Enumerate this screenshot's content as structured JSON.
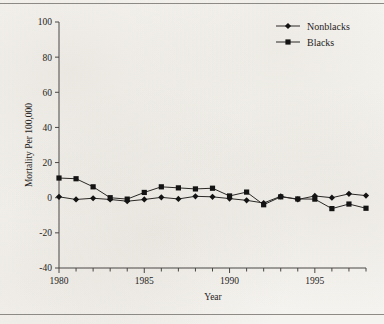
{
  "figure": {
    "background_color": "#f4f2ee",
    "ink_color": "#1a1a1a",
    "top_rule": "horizontal-rule",
    "bottom_rule": "horizontal-rule"
  },
  "chart_data": {
    "type": "line",
    "title": "",
    "xlabel": "Year",
    "ylabel": "Mortality Per 100,000",
    "xlim": [
      1980,
      1998
    ],
    "ylim": [
      -40,
      100
    ],
    "xticks": [
      1980,
      1985,
      1990,
      1995
    ],
    "xtick_labels": [
      "1980",
      "1985",
      "1990",
      "1995"
    ],
    "x_minor_ticks": [
      1981,
      1982,
      1983,
      1984,
      1986,
      1987,
      1988,
      1989,
      1991,
      1992,
      1993,
      1994,
      1996,
      1997,
      1998
    ],
    "yticks": [
      -40,
      -20,
      0,
      20,
      40,
      60,
      80,
      100
    ],
    "ytick_labels": [
      "-40",
      "-20",
      "0",
      "20",
      "40",
      "60",
      "80",
      "100"
    ],
    "grid": false,
    "legend_position": "top-right",
    "x": [
      1980,
      1981,
      1982,
      1983,
      1984,
      1985,
      1986,
      1987,
      1988,
      1989,
      1990,
      1991,
      1992,
      1993,
      1994,
      1995,
      1996,
      1997,
      1998
    ],
    "series": [
      {
        "name": "Nonblacks",
        "marker": "diamond",
        "color": "#141313",
        "values": [
          0.5,
          -1.0,
          -0.3,
          -1.0,
          -2.0,
          -1.0,
          0.2,
          -0.7,
          0.8,
          0.5,
          -0.5,
          -1.5,
          -3.0,
          0.8,
          -1.0,
          1.0,
          0.0,
          2.2,
          1.2
        ]
      },
      {
        "name": "Blacks",
        "marker": "square",
        "color": "#141313",
        "values": [
          11.2,
          10.8,
          6.2,
          0.0,
          -0.8,
          3.0,
          6.2,
          5.6,
          5.0,
          5.4,
          1.0,
          3.2,
          -4.0,
          0.5,
          -0.7,
          -0.8,
          -6.2,
          -3.6,
          -6.0
        ]
      }
    ]
  },
  "legend": {
    "entries": [
      {
        "label": "Nonblacks",
        "marker": "diamond-marker"
      },
      {
        "label": "Blacks",
        "marker": "square-marker"
      }
    ]
  },
  "axes": {
    "y_axis_title": "Mortality Per 100,000",
    "x_axis_title": "Year"
  }
}
